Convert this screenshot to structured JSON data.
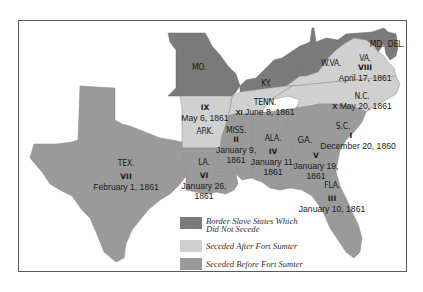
{
  "colors": {
    "border_slave": "#7a7a7a",
    "seceded_after": "#d0d0d0",
    "seceded_before": "#9a9a9a",
    "frame": "#5a5a5a",
    "background": "#ffffff"
  },
  "states": {
    "mo": {
      "abbr": "MO."
    },
    "ky": {
      "abbr": "KY."
    },
    "wva": {
      "abbr": "W.VA."
    },
    "md": {
      "abbr": "MD."
    },
    "del": {
      "abbr": "DEL."
    },
    "va": {
      "abbr": "VA.",
      "order": "VIII",
      "date": "April 17, 1861"
    },
    "nc": {
      "abbr": "N.C.",
      "order": "X",
      "date": "May 20, 1861"
    },
    "tenn": {
      "abbr": "TENN.",
      "order": "XI",
      "date": "June 8, 1861"
    },
    "ark": {
      "abbr": "ARK.",
      "order": "IX",
      "date": "May 6, 1861"
    },
    "sc": {
      "abbr": "S.C.",
      "order": "I",
      "date": "December 20, 1860"
    },
    "miss": {
      "abbr": "MISS.",
      "order": "II",
      "date_line1": "January 9,",
      "date_line2": "1861"
    },
    "fla": {
      "abbr": "FLA.",
      "order": "III",
      "date": "January 10, 1861"
    },
    "ala": {
      "abbr": "ALA.",
      "order": "IV",
      "date_line1": "January 11,",
      "date_line2": "1861"
    },
    "ga": {
      "abbr": "GA.",
      "order": "V",
      "date_line1": "January 19,",
      "date_line2": "1861"
    },
    "la": {
      "abbr": "LA.",
      "order": "VI",
      "date_line1": "January 26,",
      "date_line2": "1861"
    },
    "tex": {
      "abbr": "TEX.",
      "order": "VII",
      "date": "February 1, 1861"
    }
  },
  "legend": {
    "items": [
      {
        "label_line1": "Border Slave States Which",
        "label_line2": "Did Not Secede"
      },
      {
        "label": "Seceded After Fort Sumter"
      },
      {
        "label": "Seceded Before Fort Sumter"
      }
    ]
  }
}
